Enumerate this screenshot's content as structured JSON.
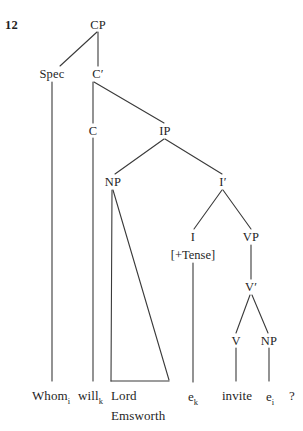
{
  "figure": {
    "number": "12",
    "sentence": "Whom will Lord Emsworth invite?"
  },
  "nodes": {
    "cp": "CP",
    "spec": "Spec",
    "cbar": "C′",
    "c": "C",
    "ip": "IP",
    "np_subject": "NP",
    "ibar": "I′",
    "i": "I",
    "i_features": "[+Tense]",
    "vp": "VP",
    "vbar": "V′",
    "v": "V",
    "np_object": "NP"
  },
  "terminals": {
    "whom": "Whom",
    "whom_index": "i",
    "will": "will",
    "will_index": "k",
    "lord": "Lord",
    "emsworth": "Emsworth",
    "trace_i_head": "e",
    "trace_i_head_index": "k",
    "invite": "invite",
    "trace_object": "e",
    "trace_object_index": "i",
    "question_mark": "?"
  },
  "colors": {
    "ink": "#1f1f1f",
    "line": "#3a3a3a",
    "background": "#ffffff"
  }
}
